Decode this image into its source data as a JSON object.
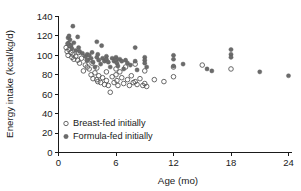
{
  "chart_data": {
    "type": "scatter",
    "title": "",
    "xlabel": "Age (mo)",
    "ylabel": "Energy intake (kcal/kg/d)",
    "xlim": [
      0,
      24
    ],
    "ylim": [
      0,
      140
    ],
    "xticks": [
      0,
      6,
      12,
      18,
      24
    ],
    "yticks": [
      0,
      20,
      40,
      60,
      80,
      100,
      120,
      140
    ],
    "xtick_labels": [
      "0",
      "6",
      "12",
      "18",
      "24"
    ],
    "ytick_labels": [
      "0",
      "20",
      "40",
      "60",
      "80",
      "100",
      "120",
      "140"
    ],
    "grid": false,
    "legend_position": "lower-left-inside",
    "series": [
      {
        "name": "Breast-fed initially",
        "marker": "open-circle",
        "color": "#585858",
        "points": [
          [
            0.8,
            108
          ],
          [
            0.9,
            104
          ],
          [
            1.0,
            112
          ],
          [
            1.0,
            100
          ],
          [
            1.1,
            106
          ],
          [
            1.2,
            110
          ],
          [
            1.3,
            103
          ],
          [
            1.4,
            98
          ],
          [
            1.5,
            101
          ],
          [
            1.6,
            96
          ],
          [
            1.8,
            99
          ],
          [
            2.0,
            95
          ],
          [
            2.1,
            103
          ],
          [
            2.2,
            92
          ],
          [
            2.4,
            97
          ],
          [
            2.6,
            84
          ],
          [
            2.8,
            90
          ],
          [
            3.0,
            95
          ],
          [
            3.0,
            88
          ],
          [
            3.2,
            86
          ],
          [
            3.4,
            80
          ],
          [
            3.5,
            92
          ],
          [
            3.6,
            76
          ],
          [
            3.8,
            82
          ],
          [
            4.0,
            75
          ],
          [
            4.0,
            87
          ],
          [
            4.1,
            73
          ],
          [
            4.2,
            79
          ],
          [
            4.4,
            72
          ],
          [
            4.6,
            77
          ],
          [
            4.8,
            70
          ],
          [
            5.0,
            83
          ],
          [
            5.0,
            74
          ],
          [
            5.2,
            69
          ],
          [
            5.4,
            62
          ],
          [
            5.6,
            78
          ],
          [
            5.8,
            72
          ],
          [
            6.0,
            86
          ],
          [
            6.0,
            80
          ],
          [
            6.1,
            74
          ],
          [
            6.2,
            69
          ],
          [
            6.4,
            83
          ],
          [
            6.6,
            77
          ],
          [
            6.8,
            71
          ],
          [
            7.0,
            88
          ],
          [
            7.2,
            75
          ],
          [
            7.4,
            69
          ],
          [
            7.6,
            79
          ],
          [
            7.8,
            72
          ],
          [
            8.0,
            91
          ],
          [
            8.0,
            73
          ],
          [
            8.2,
            70
          ],
          [
            8.5,
            76
          ],
          [
            8.8,
            69
          ],
          [
            9.0,
            84
          ],
          [
            9.0,
            71
          ],
          [
            9.2,
            68
          ],
          [
            10.0,
            75
          ],
          [
            11.0,
            73
          ],
          [
            12.0,
            78
          ],
          [
            12.0,
            88
          ],
          [
            15.0,
            90
          ],
          [
            18.0,
            86
          ]
        ]
      },
      {
        "name": "Formula-fed initially",
        "marker": "filled-circle",
        "color": "#6b6b6b",
        "points": [
          [
            1.0,
            112
          ],
          [
            1.0,
            118
          ],
          [
            1.1,
            120
          ],
          [
            1.2,
            116
          ],
          [
            1.3,
            110
          ],
          [
            1.4,
            107
          ],
          [
            1.5,
            130
          ],
          [
            1.6,
            113
          ],
          [
            1.8,
            105
          ],
          [
            2.0,
            119
          ],
          [
            2.1,
            108
          ],
          [
            2.2,
            104
          ],
          [
            2.5,
            102
          ],
          [
            2.8,
            99
          ],
          [
            3.0,
            101
          ],
          [
            3.0,
            95
          ],
          [
            3.2,
            100
          ],
          [
            3.4,
            97
          ],
          [
            3.5,
            103
          ],
          [
            3.6,
            93
          ],
          [
            3.8,
            88
          ],
          [
            4.0,
            114
          ],
          [
            4.0,
            98
          ],
          [
            4.1,
            101
          ],
          [
            4.2,
            95
          ],
          [
            4.4,
            91
          ],
          [
            4.5,
            110
          ],
          [
            4.6,
            97
          ],
          [
            4.8,
            94
          ],
          [
            5.0,
            99
          ],
          [
            5.0,
            96
          ],
          [
            5.2,
            93
          ],
          [
            5.4,
            88
          ],
          [
            5.6,
            97
          ],
          [
            5.8,
            94
          ],
          [
            6.0,
            98
          ],
          [
            6.0,
            95
          ],
          [
            6.1,
            92
          ],
          [
            6.2,
            89
          ],
          [
            6.4,
            96
          ],
          [
            6.6,
            94
          ],
          [
            6.8,
            86
          ],
          [
            7.0,
            95
          ],
          [
            7.2,
            92
          ],
          [
            7.5,
            90
          ],
          [
            8.0,
            108
          ],
          [
            8.0,
            94
          ],
          [
            8.2,
            85
          ],
          [
            9.0,
            98
          ],
          [
            9.0,
            95
          ],
          [
            9.0,
            92
          ],
          [
            9.2,
            88
          ],
          [
            12.0,
            100
          ],
          [
            12.0,
            96
          ],
          [
            12.0,
            89
          ],
          [
            13.0,
            91
          ],
          [
            15.5,
            86
          ],
          [
            16.0,
            84
          ],
          [
            18.0,
            106
          ],
          [
            18.0,
            101
          ],
          [
            18.0,
            98
          ],
          [
            21.0,
            83
          ],
          [
            24.0,
            79
          ]
        ]
      }
    ]
  },
  "legend": {
    "items": [
      {
        "label": "Breast-fed initially",
        "marker": "open-circle"
      },
      {
        "label": "Formula-fed initially",
        "marker": "filled-circle"
      }
    ]
  },
  "axes": {
    "x_title": "Age (mo)",
    "y_title": "Energy intake (kcal/kg/d)"
  },
  "colors": {
    "axis": "#1a1a1a",
    "open_marker": "#585858",
    "filled_marker": "#6b6b6b",
    "background": "#ffffff"
  }
}
